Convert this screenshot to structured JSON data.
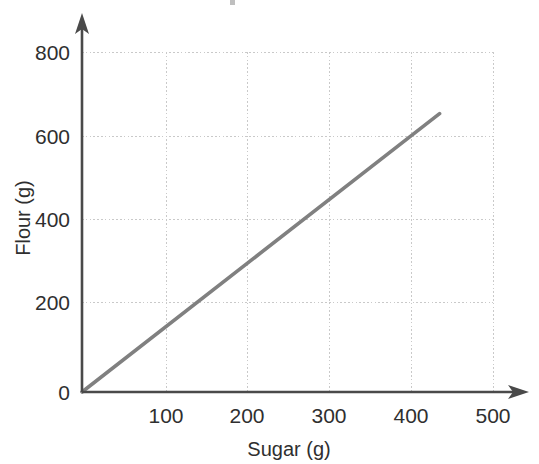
{
  "chart_data": {
    "type": "line",
    "title": "",
    "xlabel": "Sugar (g)",
    "ylabel": "Flour (g)",
    "xlim": [
      0,
      500
    ],
    "ylim": [
      0,
      800
    ],
    "xticks": [
      0,
      100,
      200,
      300,
      400,
      500
    ],
    "yticks": [
      0,
      200,
      400,
      600,
      800
    ],
    "xtick_labels": [
      "0",
      "100",
      "200",
      "300",
      "400",
      "500"
    ],
    "ytick_labels": [
      "0",
      "200",
      "400",
      "600",
      "800"
    ],
    "grid": true,
    "legend": null,
    "legend_position": "none",
    "series": [
      {
        "name": "Flour vs Sugar",
        "color": "#808080",
        "style": "solid",
        "x": [
          0,
          435
        ],
        "y": [
          0,
          655
        ],
        "points": [
          {
            "x": 0,
            "y": 0
          },
          {
            "x": 100,
            "y": 150
          },
          {
            "x": 200,
            "y": 300
          },
          {
            "x": 300,
            "y": 450
          },
          {
            "x": 400,
            "y": 600
          },
          {
            "x": 435,
            "y": 655
          }
        ],
        "slope": 1.5,
        "intercept": 0
      }
    ],
    "annotations": []
  },
  "axes": {
    "x_axis_name": "x-axis",
    "y_axis_name": "y-axis",
    "arrowheads": true
  },
  "colors": {
    "background": "#ffffff",
    "axis": "#4a4a4a",
    "gridline": "#c9c9c9",
    "text": "#2f2f2f",
    "data_line": "#808080"
  }
}
